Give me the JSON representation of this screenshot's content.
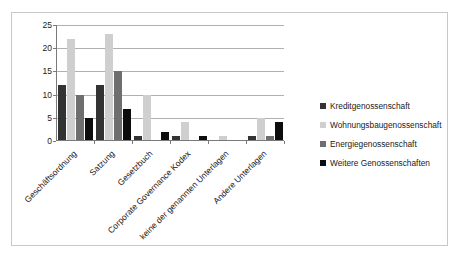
{
  "chart_data": {
    "type": "bar",
    "title": "",
    "subtitle": "",
    "xlabel": "",
    "ylabel": "",
    "ylim": [
      0,
      25
    ],
    "ytick_labels": [
      "0",
      "5",
      "10",
      "15",
      "20",
      "25"
    ],
    "ytick_values": [
      0,
      5,
      10,
      15,
      20,
      25
    ],
    "grid": true,
    "legend_position": "right",
    "categories": [
      "Geschäftsordnung",
      "Satzung",
      "Gesetzbuch",
      "Corporate Governance Kodex",
      "keine der genannten Unterlagen",
      "Andere Unterlagen"
    ],
    "series": [
      {
        "name": "Kreditgenossenschaft",
        "color": "#333333",
        "values": [
          12,
          12,
          1,
          1,
          0,
          1
        ]
      },
      {
        "name": "Wohnungsbaugenossenschaft",
        "color": "#cfcfcf",
        "values": [
          22,
          23,
          10,
          4,
          1,
          5
        ]
      },
      {
        "name": "Energiegenossenschaft",
        "color": "#6e6e6e",
        "values": [
          10,
          15,
          0,
          0,
          0,
          1
        ]
      },
      {
        "name": "Weitere Genossenschaften",
        "color": "#0d0d0d",
        "values": [
          5,
          7,
          2,
          1,
          0,
          4
        ]
      }
    ]
  }
}
